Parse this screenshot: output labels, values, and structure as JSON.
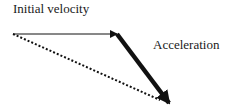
{
  "diagram": {
    "type": "vector-addition",
    "labels": {
      "initial_velocity": "Initial velocity",
      "acceleration": "Acceleration"
    },
    "vectors": [
      {
        "name": "initial-velocity",
        "from": [
          13,
          34
        ],
        "to": [
          117,
          34
        ],
        "style": "thin-solid",
        "color": "#111111"
      },
      {
        "name": "acceleration",
        "from": [
          117,
          34
        ],
        "to": [
          169,
          103
        ],
        "style": "thick-solid",
        "color": "#111111"
      },
      {
        "name": "resultant",
        "from": [
          13,
          34
        ],
        "to": [
          169,
          103
        ],
        "style": "dotted",
        "color": "#111111"
      }
    ]
  }
}
